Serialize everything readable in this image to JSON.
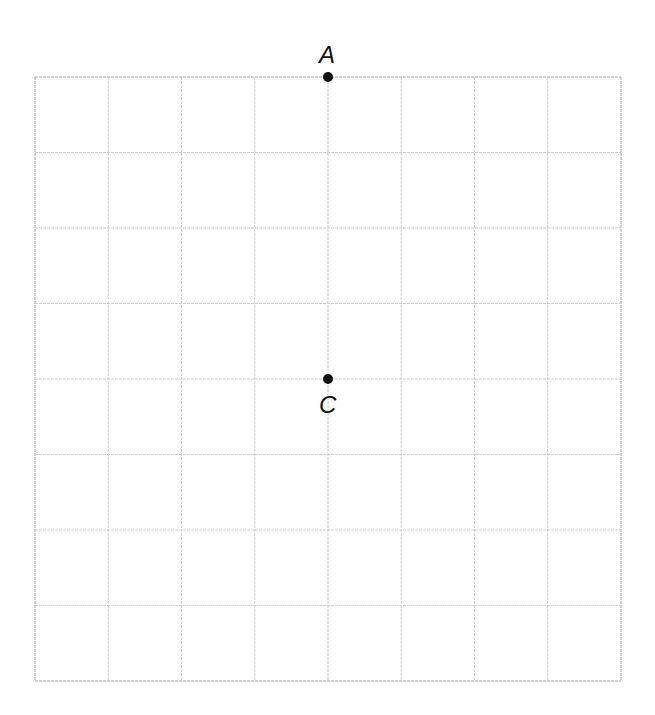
{
  "diagram": {
    "type": "coordinate-grid",
    "grid": {
      "columns": 8,
      "rows": 8,
      "left": 35,
      "top": 77,
      "right": 621,
      "bottom": 681,
      "line_color": "#cccccc",
      "border_color": "#c4c4c4"
    },
    "points": [
      {
        "name": "A",
        "col": 4,
        "row": 0,
        "label_pos": "above"
      },
      {
        "name": "C",
        "col": 4,
        "row": 4,
        "label_pos": "below"
      }
    ],
    "point_color": "#111111"
  }
}
